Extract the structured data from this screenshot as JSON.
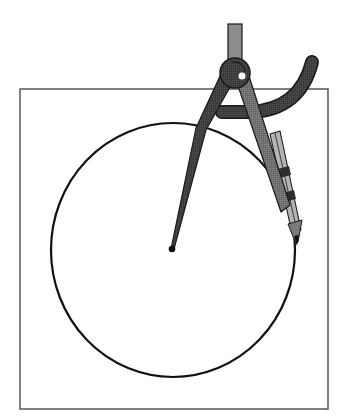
{
  "illustration": {
    "subject": "compass drawing a circle inside a square",
    "colors": {
      "background": "#ffffff",
      "square_stroke": "#555555",
      "circle_stroke": "#111111",
      "compass_dark": "#3a3a3a",
      "compass_mid": "#6e6e6e",
      "compass_light": "#9a9a9a",
      "handle": "#8c8c8c",
      "pencil_body": "#a8a8a8",
      "pencil_clamp": "#2e2e2e",
      "outline": "#1a1a1a",
      "highlight": "#ffffff"
    },
    "square": {
      "x": 20,
      "y": 89,
      "width": 308,
      "height": 320
    },
    "circle": {
      "cx": 173,
      "cy": 250,
      "rx": 122,
      "ry": 127
    },
    "needle_point": {
      "x": 172,
      "y": 249
    },
    "pencil_tip": {
      "x": 297,
      "y": 246
    },
    "hinge": {
      "cx": 235,
      "cy": 73,
      "r": 15
    }
  }
}
